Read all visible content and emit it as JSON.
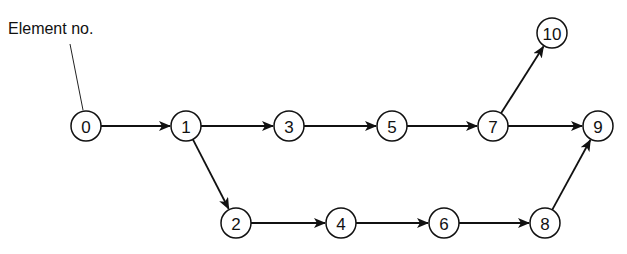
{
  "diagram": {
    "callout_label": "Element no.",
    "callout_target": "0",
    "nodes": [
      {
        "id": "0",
        "label": "0",
        "x": 86,
        "y": 126
      },
      {
        "id": "1",
        "label": "1",
        "x": 186,
        "y": 126
      },
      {
        "id": "3",
        "label": "3",
        "x": 289,
        "y": 126
      },
      {
        "id": "5",
        "label": "5",
        "x": 392,
        "y": 126
      },
      {
        "id": "7",
        "label": "7",
        "x": 493,
        "y": 126
      },
      {
        "id": "9",
        "label": "9",
        "x": 598,
        "y": 126
      },
      {
        "id": "10",
        "label": "10",
        "x": 552,
        "y": 33
      },
      {
        "id": "2",
        "label": "2",
        "x": 236,
        "y": 223
      },
      {
        "id": "4",
        "label": "4",
        "x": 341,
        "y": 223
      },
      {
        "id": "6",
        "label": "6",
        "x": 444,
        "y": 223
      },
      {
        "id": "8",
        "label": "8",
        "x": 545,
        "y": 223
      }
    ],
    "edges": [
      {
        "from": "0",
        "to": "1"
      },
      {
        "from": "1",
        "to": "3"
      },
      {
        "from": "3",
        "to": "5"
      },
      {
        "from": "5",
        "to": "7"
      },
      {
        "from": "7",
        "to": "9"
      },
      {
        "from": "7",
        "to": "10"
      },
      {
        "from": "1",
        "to": "2"
      },
      {
        "from": "2",
        "to": "4"
      },
      {
        "from": "4",
        "to": "6"
      },
      {
        "from": "6",
        "to": "8"
      },
      {
        "from": "8",
        "to": "9"
      }
    ]
  }
}
